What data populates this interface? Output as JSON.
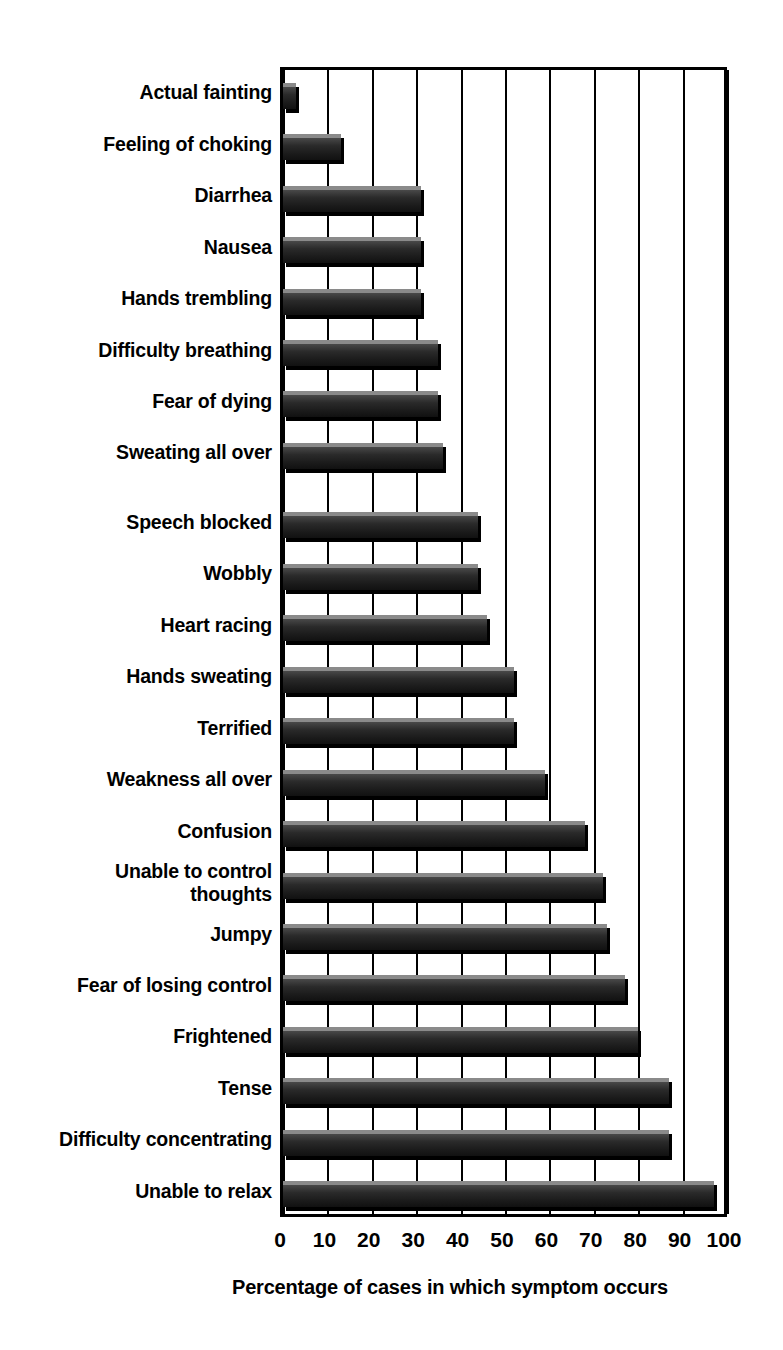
{
  "chart_data": {
    "type": "bar",
    "orientation": "horizontal",
    "title": "",
    "xlabel": "Percentage of cases in which symptom occurs",
    "ylabel": "Symptoms",
    "xlim": [
      0,
      100
    ],
    "xticks": [
      0,
      10,
      20,
      30,
      40,
      50,
      60,
      70,
      80,
      90,
      100
    ],
    "xtick_labels": [
      "0",
      "10",
      "20",
      "30",
      "40",
      "50",
      "60",
      "70",
      "80",
      "90",
      "100"
    ],
    "grid": "vertical",
    "legend": "none",
    "bar_color": "#2a2a2a",
    "categories": [
      "Actual fainting",
      "Feeling of choking",
      "Diarrhea",
      "Nausea",
      "Hands trembling",
      "Difficulty breathing",
      "Fear of dying",
      "Sweating all over",
      "Speech blocked",
      "Wobbly",
      "Heart racing",
      "Hands sweating",
      "Terrified",
      "Weakness all over",
      "Confusion",
      "Unable to control thoughts",
      "Jumpy",
      "Fear of losing control",
      "Frightened",
      "Tense",
      "Difficulty concentrating",
      "Unable to relax"
    ],
    "values": [
      3,
      13,
      31,
      31,
      31,
      35,
      35,
      36,
      44,
      44,
      46,
      52,
      52,
      59,
      68,
      72,
      73,
      77,
      80,
      87,
      87,
      97
    ]
  },
  "axes": {
    "y_title": "Symptoms",
    "x_title": "Percentage of cases in which symptom occurs"
  }
}
